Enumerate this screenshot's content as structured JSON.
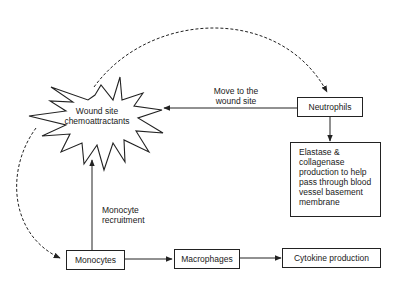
{
  "diagram": {
    "nodes": {
      "wound_site": {
        "label": "Wound site chemoattractants",
        "line1": "Wound site",
        "line2": "chemoattractants",
        "shape": "starburst"
      },
      "neutrophils": {
        "label": "Neutrophils",
        "shape": "box"
      },
      "elastase": {
        "label": "Elastase & collagenase production to help pass through blood vessel basement membrane",
        "lines": [
          "Elastase &",
          "collagenase",
          "production to help",
          "pass through blood",
          "vessel basement",
          "membrane"
        ],
        "shape": "box"
      },
      "monocytes": {
        "label": "Monocytes",
        "shape": "box"
      },
      "macrophages": {
        "label": "Macrophages",
        "shape": "box"
      },
      "cytokine": {
        "label": "Cytokine production",
        "shape": "box"
      }
    },
    "edges": [
      {
        "from": "neutrophils",
        "to": "wound_site",
        "style": "solid",
        "label": "Move to the wound site",
        "label_line1": "Move to the",
        "label_line2": "wound site"
      },
      {
        "from": "wound_site",
        "to": "neutrophils",
        "style": "dashed-curve",
        "label": ""
      },
      {
        "from": "neutrophils",
        "to": "elastase",
        "style": "solid",
        "label": ""
      },
      {
        "from": "monocytes",
        "to": "wound_site",
        "style": "solid",
        "label": "Monocyte recruitment",
        "label_line1": "Monocyte",
        "label_line2": "recruitment"
      },
      {
        "from": "wound_site",
        "to": "monocytes",
        "style": "dashed-curve",
        "label": ""
      },
      {
        "from": "monocytes",
        "to": "macrophages",
        "style": "solid",
        "label": ""
      },
      {
        "from": "macrophages",
        "to": "cytokine",
        "style": "solid",
        "label": ""
      }
    ]
  }
}
